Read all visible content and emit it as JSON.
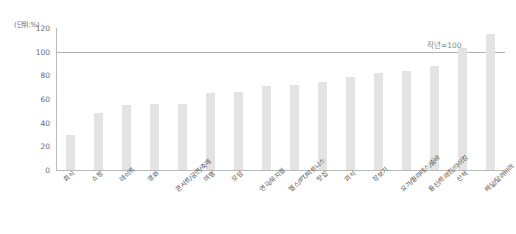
{
  "chart": {
    "unit_label": "(단위:%)",
    "reference_note": "작년=100"
  },
  "chart_data": {
    "type": "bar",
    "title": "",
    "xlabel": "",
    "ylabel": "",
    "unit": "(단위:%)",
    "ylim": [
      0,
      120
    ],
    "yticks": [
      0,
      20,
      40,
      60,
      80,
      100,
      120
    ],
    "ytick_labels": [
      "0",
      "20",
      "40",
      "60",
      "80",
      "100",
      "120"
    ],
    "grid": false,
    "legend": null,
    "reference_line": {
      "value": 100,
      "label": "작년=100"
    },
    "bar_color": "#e3e3e3",
    "categories": [
      "회식",
      "쇼핑",
      "데이트",
      "영화",
      "콘서트/공연/축제",
      "여행",
      "모임",
      "연극/뮤지컬",
      "헬스/PT/피트니스",
      "맛집",
      "외식",
      "장보기",
      "요가/필라테스/줌바",
      "등산/트래킹/하이킹",
      "산책",
      "배달/달려버려"
    ],
    "values": [
      30,
      48,
      55,
      56,
      56,
      65,
      66,
      71,
      72,
      74,
      79,
      82,
      84,
      88,
      103,
      115
    ]
  }
}
